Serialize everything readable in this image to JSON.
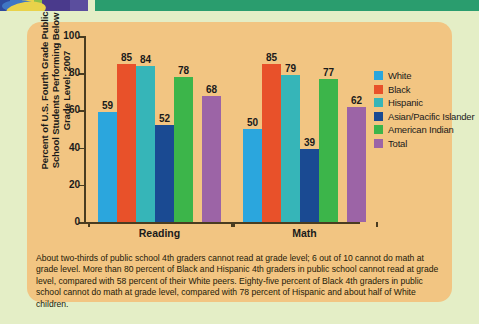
{
  "page": {
    "background_color": "#e4eec6",
    "panel_color": "#f2c582",
    "green_bar_color": "#2a9d6e"
  },
  "chart_data": {
    "type": "bar",
    "title": "",
    "ylabel": "Percent of U.S. Fourth Grade Public School Students Performing Below Grade Level: 2007",
    "xlabel": "",
    "categories": [
      "Reading",
      "Math"
    ],
    "ylim": [
      0,
      100
    ],
    "yticks": [
      0,
      20,
      40,
      60,
      80,
      100
    ],
    "grid": false,
    "legend_position": "right",
    "series": [
      {
        "name": "White",
        "color": "#2ba6dd",
        "values": [
          59,
          50
        ]
      },
      {
        "name": "Black",
        "color": "#e8512a",
        "values": [
          85,
          85
        ]
      },
      {
        "name": "Hispanic",
        "color": "#36b5b8",
        "values": [
          84,
          79
        ]
      },
      {
        "name": "Asian/Pacific Islander",
        "color": "#1a4a92",
        "values": [
          52,
          39
        ]
      },
      {
        "name": "American Indian",
        "color": "#3cb54a",
        "values": [
          78,
          77
        ]
      },
      {
        "name": "Total",
        "color": "#9c64a6",
        "values": [
          68,
          62
        ]
      }
    ]
  },
  "caption": {
    "text": "About two-thirds of public school 4th graders cannot read at grade level; 6 out of 10 cannot do math at grade level. More than 80 percent of Black and Hispanic 4th graders in public school cannot read at grade level, compared with 58 percent of their White peers. Eighty-five percent of Black 4th graders in public school cannot do math at grade level, compared with 78 percent of Hispanic and about half of White children."
  }
}
